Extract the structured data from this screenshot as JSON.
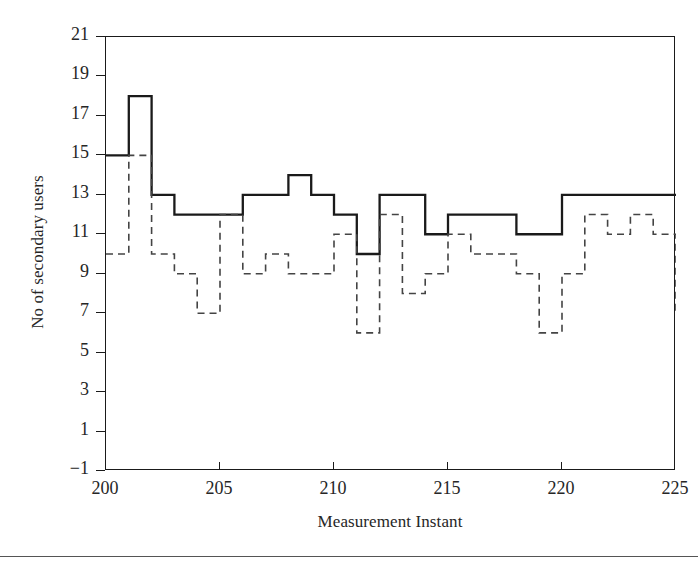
{
  "figure": {
    "background": "#ffffff",
    "line_color": "#1a1a1a",
    "text_color": "#262626"
  },
  "axes": {
    "xlabel": "Measurement Instant",
    "ylabel": "No of secondary users",
    "x_ticks": [
      200,
      205,
      210,
      215,
      220,
      225
    ],
    "y_ticks": [
      -1,
      1,
      3,
      5,
      7,
      9,
      11,
      13,
      15,
      17,
      19,
      21
    ],
    "xlim": [
      200,
      225
    ],
    "ylim": [
      -1,
      21
    ],
    "grid": false,
    "frame": true
  },
  "chart_data": {
    "type": "line",
    "title": "",
    "xlabel": "Measurement Instant",
    "ylabel": "No of secondary users",
    "xlim": [
      200,
      225
    ],
    "ylim": [
      -1,
      21
    ],
    "grid": false,
    "legend": "none",
    "drawstyle": "steps-post",
    "x": [
      200,
      201,
      202,
      203,
      204,
      205,
      206,
      207,
      208,
      209,
      210,
      211,
      212,
      213,
      214,
      215,
      216,
      217,
      218,
      219,
      220,
      221,
      222,
      223,
      224,
      225
    ],
    "series": [
      {
        "name": "solid-series",
        "style": "solid",
        "color": "#1a1a1a",
        "width": 2.2,
        "values": [
          15,
          18,
          13,
          12,
          12,
          12,
          13,
          13,
          14,
          13,
          12,
          10,
          13,
          13,
          11,
          12,
          12,
          12,
          11,
          11,
          13,
          13,
          13,
          13,
          13,
          13
        ]
      },
      {
        "name": "dashed-series",
        "style": "dashed",
        "color": "#444444",
        "width": 1.5,
        "values": [
          10,
          15,
          10,
          9,
          7,
          12,
          9,
          10,
          9,
          9,
          11,
          6,
          12,
          8,
          9,
          11,
          10,
          10,
          9,
          6,
          9,
          12,
          11,
          12,
          11,
          7
        ]
      }
    ]
  }
}
